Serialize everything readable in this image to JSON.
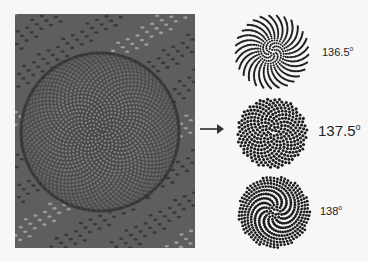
{
  "figure": {
    "photo": {
      "subject": "sunflower seed head",
      "alt": "Close-up photograph of sunflower head showing spiral seed arrangement"
    },
    "arrow": {
      "direction": "right",
      "color": "#444444"
    },
    "patterns": [
      {
        "angle": "136.5",
        "unit": "o",
        "type": "radial-arms"
      },
      {
        "angle": "137.5",
        "unit": "o",
        "type": "uniform-packing"
      },
      {
        "angle": "138",
        "unit": "o",
        "type": "spiral-arms"
      }
    ]
  },
  "colors": {
    "background": "#f7f7f7",
    "dots": "#1e1e1e",
    "photo_base": "#6a6a6a"
  }
}
